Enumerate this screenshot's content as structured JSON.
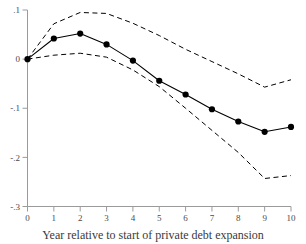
{
  "chart_data": {
    "type": "line",
    "title": "",
    "xlabel": "Year relative to start of  private debt expansion",
    "ylabel": "",
    "x": [
      0,
      1,
      2,
      3,
      4,
      5,
      6,
      7,
      8,
      9,
      10
    ],
    "xlim": [
      0,
      10
    ],
    "ylim": [
      -0.3,
      0.1
    ],
    "xticks": [
      0,
      1,
      2,
      3,
      4,
      5,
      6,
      7,
      8,
      9,
      10
    ],
    "xtick_labels": [
      "0",
      "1",
      "2",
      "3",
      "4",
      "5",
      "6",
      "7",
      "8",
      "9",
      "10"
    ],
    "yticks": [
      0.1,
      0,
      -0.1,
      -0.2,
      -0.3
    ],
    "ytick_labels": [
      ".1",
      "0",
      "-.1",
      "-.2",
      "-.3"
    ],
    "grid": false,
    "legend": "none",
    "series": [
      {
        "name": "point-estimate",
        "style": "solid-with-markers",
        "values": [
          0.0,
          0.042,
          0.052,
          0.03,
          -0.003,
          -0.044,
          -0.072,
          -0.102,
          -0.127,
          -0.148,
          -0.138
        ]
      },
      {
        "name": "confidence-upper",
        "style": "dashed",
        "values": [
          0.0,
          0.072,
          0.095,
          0.093,
          0.073,
          0.048,
          0.02,
          -0.005,
          -0.03,
          -0.057,
          -0.042
        ]
      },
      {
        "name": "confidence-lower",
        "style": "dashed",
        "values": [
          0.0,
          0.008,
          0.012,
          0.004,
          -0.022,
          -0.056,
          -0.1,
          -0.145,
          -0.19,
          -0.243,
          -0.237
        ]
      }
    ],
    "colors": {
      "line": "#000000",
      "band": "#000000",
      "axis": "#9a9a9a",
      "tick_label": "#4a4a4a",
      "background": "#ffffff"
    }
  }
}
